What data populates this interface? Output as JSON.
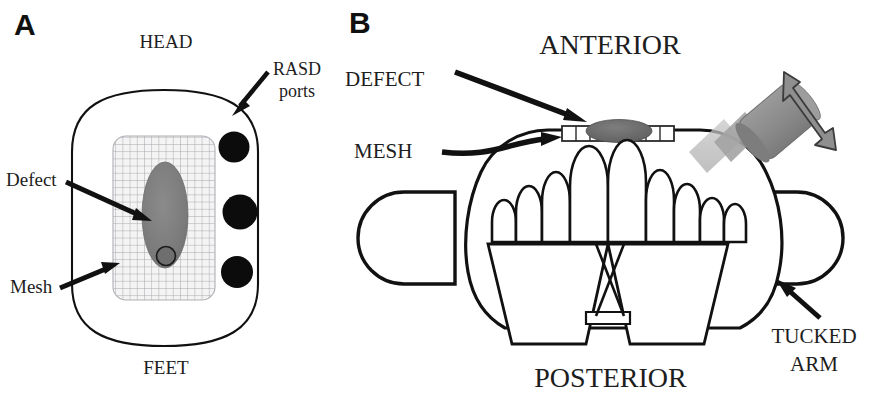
{
  "figure": {
    "panels": [
      {
        "letter": "A",
        "view": "axial-schematic-patient-from-above",
        "labels": {
          "head": "HEAD",
          "feet": "FEET",
          "ports_line1": "RASD",
          "ports_line2": "ports",
          "defect": "Defect",
          "mesh": "Mesh"
        },
        "elements": {
          "port_count": 3,
          "body_outline_color": "#111111",
          "mesh_fill_color": "#f2f2f2",
          "mesh_grid_color": "#9a9aa0",
          "defect_fill_color": "#7c7c7c",
          "port_fill_color": "#0d0d0d"
        }
      },
      {
        "letter": "B",
        "view": "coronal-schematic-patient-cross-section",
        "labels": {
          "anterior": "ANTERIOR",
          "posterior": "POSTERIOR",
          "defect": "DEFECT",
          "mesh": "MESH",
          "tucked_arm_line1": "TUCKED",
          "tucked_arm_line2": "ARM"
        },
        "elements": {
          "instrument_head_color": "#8c8c8c",
          "instrument_shaft_color": "#b9b9b9",
          "motion_arrow_color": "#8c8c8c",
          "defect_fill_color": "#6b6b6b",
          "mesh_segment_count": 8,
          "outline_color": "#111111"
        }
      }
    ]
  }
}
